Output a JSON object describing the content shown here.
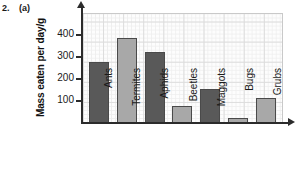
{
  "question": {
    "number": "2.",
    "part": "(a)"
  },
  "chart_data": {
    "type": "bar",
    "title": "",
    "xlabel": "",
    "ylabel": "Mass eaten per day/g",
    "ylim": [
      0,
      500
    ],
    "yticks": [
      100,
      200,
      300,
      400
    ],
    "grid": true,
    "legend": null,
    "categories": [
      "Ants",
      "Termites",
      "Aphids",
      "Beetles",
      "Maggots",
      "Bugs",
      "Grubs"
    ],
    "values": [
      275,
      380,
      320,
      75,
      150,
      20,
      110
    ],
    "bar_colors": [
      "#595959",
      "#a8a8a8",
      "#595959",
      "#a8a8a8",
      "#595959",
      "#a8a8a8",
      "#a8a8a8"
    ]
  },
  "colors": {
    "bar_dark": "#595959",
    "bar_light": "#a8a8a8",
    "axis": "#2b2b2b",
    "grid_major": "#dcdcdc",
    "grid_minor": "#eeeeee"
  }
}
